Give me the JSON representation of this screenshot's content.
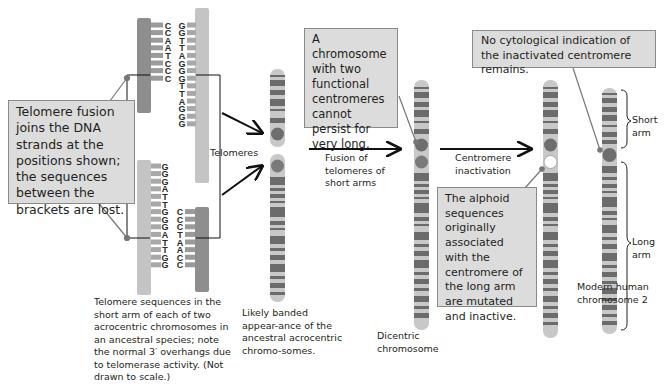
{
  "callouts": {
    "telomere_fusion": "Telomere fusion joins the DNA strands at the positions shown; the sequences between the brackets are lost.",
    "dicentric_unstable": "A chromosome with two functional centromeres cannot persist for very long.",
    "no_indication": "No cytological indication of the inactivated centromere remains.",
    "alphoid": "The alphoid sequences originally associated with the centromere of the long arm are mutated and inactive."
  },
  "labels": {
    "telomeres": "Telomeres",
    "fusion_step": "Fusion of telomeres of short arms",
    "inactivation_step": "Centromere inactivation",
    "short_arm": "Short arm",
    "long_arm": "Long arm"
  },
  "captions": {
    "telomere_sequences": "Telomere sequences in the short arm of each of two acrocentric chromosomes in an ancestral species; note the normal 3′ overhangs due to telomerase activity. (Not drawn to scale.)",
    "ancestral": "Likely banded appear-ance of the ancestral acrocentric chromo-somes.",
    "dicentric": "Dicentric chromosome",
    "modern": "Modern human chromosome 2"
  },
  "dna": {
    "top_left_strand": [
      "C",
      "C",
      "A",
      "A",
      "T",
      "C",
      "C",
      "C"
    ],
    "top_right_strand": [
      "G",
      "G",
      "T",
      "T",
      "A",
      "G",
      "G",
      "G",
      "T",
      "T",
      "A",
      "G",
      "G",
      "G"
    ],
    "bottom_left_strand": [
      "G",
      "G",
      "G",
      "A",
      "T",
      "T",
      "G",
      "G",
      "G",
      "A",
      "T",
      "T",
      "G",
      "G"
    ],
    "bottom_right_strand": [
      "C",
      "C",
      "C",
      "T",
      "A",
      "A",
      "C",
      "C"
    ]
  },
  "colors": {
    "callout_bg": "#dcdcdc",
    "band_dark": "#6b6b6b",
    "band_light": "#c8c8c8",
    "centromere": "#6e6e6e",
    "arrow": "#111111"
  }
}
